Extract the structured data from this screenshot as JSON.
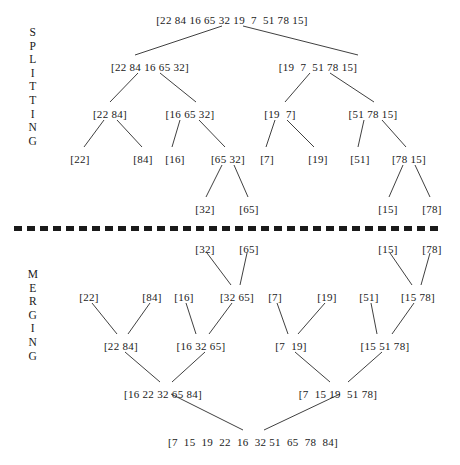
{
  "diagram": {
    "phases": [
      {
        "id": "splitting",
        "label": "SPLITTING",
        "letters": [
          "S",
          "P",
          "L",
          "I",
          "T",
          "T",
          "I",
          "N",
          "G"
        ],
        "label_x": 24,
        "label_y": 26
      },
      {
        "id": "merging",
        "label": "MERGING",
        "letters": [
          "M",
          "E",
          "R",
          "G",
          "I",
          "N",
          "G"
        ],
        "label_x": 24,
        "label_y": 268
      }
    ],
    "divider": {
      "name": "phase-divider",
      "x": 14,
      "y": 226,
      "width": 428,
      "color": "#1a1a1a",
      "dash": "8 5",
      "thickness": 5
    },
    "nodes": [
      {
        "id": "s0",
        "phase": "splitting",
        "label": "[22 84 16 65 32 19  7  51 78 15]",
        "x": 232,
        "y": 14
      },
      {
        "id": "s1a",
        "phase": "splitting",
        "label": "[22 84 16 65 32]",
        "x": 150,
        "y": 61
      },
      {
        "id": "s1b",
        "phase": "splitting",
        "label": "[19  7  51 78 15]",
        "x": 318,
        "y": 61
      },
      {
        "id": "s2a",
        "phase": "splitting",
        "label": "[22 84]",
        "x": 110,
        "y": 108
      },
      {
        "id": "s2b",
        "phase": "splitting",
        "label": "[16 65 32]",
        "x": 190,
        "y": 108
      },
      {
        "id": "s2c",
        "phase": "splitting",
        "label": "[19  7]",
        "x": 280,
        "y": 108
      },
      {
        "id": "s2d",
        "phase": "splitting",
        "label": "[51 78 15]",
        "x": 373,
        "y": 108
      },
      {
        "id": "s3a",
        "phase": "splitting",
        "label": "[22]",
        "x": 80,
        "y": 153
      },
      {
        "id": "s3b",
        "phase": "splitting",
        "label": "[84]",
        "x": 143,
        "y": 153
      },
      {
        "id": "s3c",
        "phase": "splitting",
        "label": "[16]",
        "x": 175,
        "y": 153
      },
      {
        "id": "s3d",
        "phase": "splitting",
        "label": "[65 32]",
        "x": 228,
        "y": 153
      },
      {
        "id": "s3e",
        "phase": "splitting",
        "label": "[7]",
        "x": 267,
        "y": 153
      },
      {
        "id": "s3f",
        "phase": "splitting",
        "label": "[19]",
        "x": 318,
        "y": 153
      },
      {
        "id": "s3g",
        "phase": "splitting",
        "label": "[51]",
        "x": 360,
        "y": 153
      },
      {
        "id": "s3h",
        "phase": "splitting",
        "label": "[78 15]",
        "x": 409,
        "y": 153
      },
      {
        "id": "s4a",
        "phase": "splitting",
        "label": "[32]",
        "x": 205,
        "y": 203
      },
      {
        "id": "s4b",
        "phase": "splitting",
        "label": "[65]",
        "x": 249,
        "y": 203
      },
      {
        "id": "s4c",
        "phase": "splitting",
        "label": "[15]",
        "x": 388,
        "y": 203
      },
      {
        "id": "s4d",
        "phase": "splitting",
        "label": "[78]",
        "x": 432,
        "y": 203
      },
      {
        "id": "m0a",
        "phase": "merging",
        "label": "[32]",
        "x": 205,
        "y": 243
      },
      {
        "id": "m0b",
        "phase": "merging",
        "label": "[65]",
        "x": 249,
        "y": 243
      },
      {
        "id": "m0c",
        "phase": "merging",
        "label": "[15]",
        "x": 388,
        "y": 243
      },
      {
        "id": "m0d",
        "phase": "merging",
        "label": "[78]",
        "x": 432,
        "y": 243
      },
      {
        "id": "m1a",
        "phase": "merging",
        "label": "[22]",
        "x": 89,
        "y": 291
      },
      {
        "id": "m1b",
        "phase": "merging",
        "label": "[84]",
        "x": 152,
        "y": 291
      },
      {
        "id": "m1c",
        "phase": "merging",
        "label": "[16]",
        "x": 184,
        "y": 291
      },
      {
        "id": "m1d",
        "phase": "merging",
        "label": "[32 65]",
        "x": 237,
        "y": 291
      },
      {
        "id": "m1e",
        "phase": "merging",
        "label": "[7]",
        "x": 275,
        "y": 291
      },
      {
        "id": "m1f",
        "phase": "merging",
        "label": "[19]",
        "x": 327,
        "y": 291
      },
      {
        "id": "m1g",
        "phase": "merging",
        "label": "[51]",
        "x": 369,
        "y": 291
      },
      {
        "id": "m1h",
        "phase": "merging",
        "label": "[15 78]",
        "x": 418,
        "y": 291
      },
      {
        "id": "m2a",
        "phase": "merging",
        "label": "[22 84]",
        "x": 121,
        "y": 340
      },
      {
        "id": "m2b",
        "phase": "merging",
        "label": "[16 32 65]",
        "x": 201,
        "y": 340
      },
      {
        "id": "m2c",
        "phase": "merging",
        "label": "[7  19]",
        "x": 291,
        "y": 340
      },
      {
        "id": "m2d",
        "phase": "merging",
        "label": "[15 51 78]",
        "x": 385,
        "y": 340
      },
      {
        "id": "m3a",
        "phase": "merging",
        "label": "[16 22 32 65 84]",
        "x": 163,
        "y": 388
      },
      {
        "id": "m3b",
        "phase": "merging",
        "label": "[7  15 19  51 78]",
        "x": 338,
        "y": 388
      },
      {
        "id": "m4",
        "phase": "merging",
        "label": "[7  15  19  22  16  32 51  65  78  84]",
        "x": 253,
        "y": 436
      }
    ],
    "edges": [
      {
        "from": "s0",
        "to": "s1a",
        "x1": 222,
        "y1": 26,
        "x2": 135,
        "y2": 55
      },
      {
        "from": "s0",
        "to": "s1b",
        "x1": 243,
        "y1": 26,
        "x2": 358,
        "y2": 55
      },
      {
        "from": "s1a",
        "to": "s2a",
        "x1": 138,
        "y1": 73,
        "x2": 110,
        "y2": 102
      },
      {
        "from": "s1a",
        "to": "s2b",
        "x1": 160,
        "y1": 73,
        "x2": 196,
        "y2": 102
      },
      {
        "from": "s1b",
        "to": "s2c",
        "x1": 310,
        "y1": 73,
        "x2": 285,
        "y2": 102
      },
      {
        "from": "s1b",
        "to": "s2d",
        "x1": 330,
        "y1": 73,
        "x2": 374,
        "y2": 102
      },
      {
        "from": "s2a",
        "to": "s3a",
        "x1": 104,
        "y1": 120,
        "x2": 84,
        "y2": 147
      },
      {
        "from": "s2a",
        "to": "s3b",
        "x1": 117,
        "y1": 120,
        "x2": 142,
        "y2": 147
      },
      {
        "from": "s2b",
        "to": "s3c",
        "x1": 180,
        "y1": 120,
        "x2": 172,
        "y2": 147
      },
      {
        "from": "s2b",
        "to": "s3d",
        "x1": 199,
        "y1": 120,
        "x2": 225,
        "y2": 147
      },
      {
        "from": "s2c",
        "to": "s3e",
        "x1": 275,
        "y1": 120,
        "x2": 266,
        "y2": 147
      },
      {
        "from": "s2c",
        "to": "s3f",
        "x1": 287,
        "y1": 120,
        "x2": 314,
        "y2": 147
      },
      {
        "from": "s2d",
        "to": "s3g",
        "x1": 364,
        "y1": 120,
        "x2": 358,
        "y2": 147
      },
      {
        "from": "s2d",
        "to": "s3h",
        "x1": 382,
        "y1": 120,
        "x2": 406,
        "y2": 147
      },
      {
        "from": "s3d",
        "to": "s4a",
        "x1": 222,
        "y1": 165,
        "x2": 206,
        "y2": 197
      },
      {
        "from": "s3d",
        "to": "s4b",
        "x1": 234,
        "y1": 165,
        "x2": 248,
        "y2": 197
      },
      {
        "from": "s3h",
        "to": "s4c",
        "x1": 403,
        "y1": 165,
        "x2": 389,
        "y2": 197
      },
      {
        "from": "s3h",
        "to": "s4d",
        "x1": 415,
        "y1": 165,
        "x2": 430,
        "y2": 197
      },
      {
        "from": "m0a",
        "to": "m1d",
        "x1": 207,
        "y1": 253,
        "x2": 231,
        "y2": 285
      },
      {
        "from": "m0b",
        "to": "m1d",
        "x1": 247,
        "y1": 253,
        "x2": 240,
        "y2": 285
      },
      {
        "from": "m0c",
        "to": "m1h",
        "x1": 390,
        "y1": 253,
        "x2": 412,
        "y2": 285
      },
      {
        "from": "m0d",
        "to": "m1h",
        "x1": 430,
        "y1": 253,
        "x2": 421,
        "y2": 285
      },
      {
        "from": "m1a",
        "to": "m2a",
        "x1": 92,
        "y1": 303,
        "x2": 117,
        "y2": 334
      },
      {
        "from": "m1b",
        "to": "m2a",
        "x1": 150,
        "y1": 303,
        "x2": 128,
        "y2": 334
      },
      {
        "from": "m1c",
        "to": "m2b",
        "x1": 186,
        "y1": 303,
        "x2": 196,
        "y2": 334
      },
      {
        "from": "m1d",
        "to": "m2b",
        "x1": 232,
        "y1": 303,
        "x2": 209,
        "y2": 334
      },
      {
        "from": "m1e",
        "to": "m2c",
        "x1": 277,
        "y1": 303,
        "x2": 288,
        "y2": 334
      },
      {
        "from": "m1f",
        "to": "m2c",
        "x1": 325,
        "y1": 303,
        "x2": 298,
        "y2": 334
      },
      {
        "from": "m1g",
        "to": "m2d",
        "x1": 371,
        "y1": 303,
        "x2": 377,
        "y2": 334
      },
      {
        "from": "m1h",
        "to": "m2d",
        "x1": 414,
        "y1": 303,
        "x2": 392,
        "y2": 334
      },
      {
        "from": "m2a",
        "to": "m3a",
        "x1": 125,
        "y1": 352,
        "x2": 160,
        "y2": 382
      },
      {
        "from": "m2b",
        "to": "m3a",
        "x1": 205,
        "y1": 352,
        "x2": 172,
        "y2": 382
      },
      {
        "from": "m2c",
        "to": "m3b",
        "x1": 295,
        "y1": 352,
        "x2": 330,
        "y2": 382
      },
      {
        "from": "m2d",
        "to": "m3b",
        "x1": 382,
        "y1": 352,
        "x2": 348,
        "y2": 382
      },
      {
        "from": "m3a",
        "to": "m4",
        "x1": 171,
        "y1": 394,
        "x2": 243,
        "y2": 430
      },
      {
        "from": "m3b",
        "to": "m4",
        "x1": 340,
        "y1": 394,
        "x2": 264,
        "y2": 430
      }
    ]
  },
  "colors": {
    "background": "#ffffff",
    "text": "#1a1a1a",
    "edge": "#2a2a2a",
    "divider": "#1a1a1a"
  }
}
